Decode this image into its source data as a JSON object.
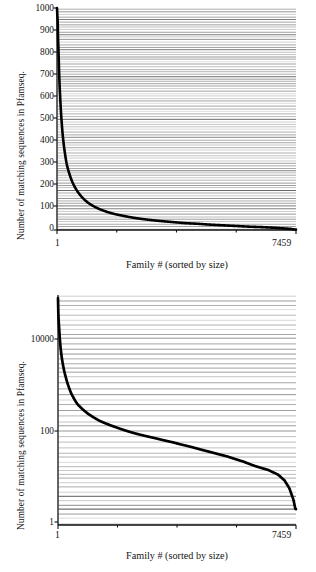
{
  "figure": {
    "caption_absent": true,
    "panel_count": 2
  },
  "chart_data": [
    {
      "type": "line",
      "panel": "top",
      "scale": "linear-y",
      "title": "",
      "xlabel": "Family # (sorted by size)",
      "ylabel": "Number of matching sequences in Pfamseq.",
      "xlim": [
        1,
        7459
      ],
      "ylim": [
        0,
        1000
      ],
      "xticks": [
        1,
        7459
      ],
      "xticklabels": [
        "1",
        "7459"
      ],
      "yticks": [
        0,
        100,
        200,
        300,
        400,
        500,
        600,
        700,
        800,
        900,
        1000
      ],
      "yticklabels": [
        "0",
        "100",
        "200",
        "300",
        "400",
        "500",
        "600",
        "700",
        "800",
        "900",
        "1000"
      ],
      "grid": "horizontal-dense",
      "series_name": "family size",
      "x": [
        1,
        20,
        50,
        100,
        150,
        200,
        250,
        300,
        400,
        500,
        600,
        700,
        800,
        1000,
        1200,
        1400,
        1600,
        1800,
        2000,
        2400,
        2800,
        3200,
        3600,
        4000,
        4400,
        4800,
        5200,
        5600,
        6000,
        6400,
        6800,
        7100,
        7300,
        7459
      ],
      "y": [
        1000,
        960,
        800,
        600,
        480,
        400,
        345,
        300,
        248,
        210,
        183,
        162,
        145,
        120,
        103,
        90,
        80,
        72,
        66,
        55,
        47,
        41,
        36,
        31,
        28,
        24,
        21,
        18,
        15,
        13,
        10,
        7,
        5,
        2
      ]
    },
    {
      "type": "line",
      "panel": "bottom",
      "scale": "log-y",
      "title": "",
      "xlabel": "Family # (sorted by size)",
      "ylabel": "Number of matching sequences in Pfamseq.",
      "xlim": [
        1,
        7459
      ],
      "ylim": [
        1,
        20000
      ],
      "xticks": [
        1,
        7459
      ],
      "xticklabels": [
        "1",
        "7459"
      ],
      "yticks": [
        1,
        100,
        10000
      ],
      "yticklabels": [
        "1",
        "100",
        "10000"
      ],
      "grid": "horizontal-dense",
      "series_name": "family size",
      "x": [
        1,
        5,
        15,
        40,
        80,
        150,
        250,
        400,
        600,
        900,
        1300,
        1800,
        2400,
        3000,
        3600,
        4200,
        4800,
        5300,
        5800,
        6200,
        6600,
        6900,
        7100,
        7250,
        7380,
        7440,
        7459
      ],
      "y": [
        20000,
        14000,
        9500,
        5200,
        2400,
        1150,
        620,
        330,
        200,
        135,
        95,
        72,
        55,
        45,
        37,
        30,
        24,
        20,
        16,
        13,
        11,
        9,
        7,
        5,
        3,
        2,
        2
      ]
    }
  ]
}
